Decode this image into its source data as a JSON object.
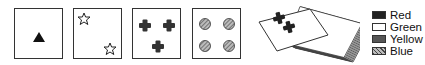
{
  "cards": [
    {
      "shape": "triangle",
      "count": 1,
      "color": "Red"
    },
    {
      "shape": "star",
      "count": 2,
      "color": "Green"
    },
    {
      "shape": "cross",
      "count": 3,
      "color": "Yellow"
    },
    {
      "shape": "circle",
      "count": 4,
      "color": "Blue"
    }
  ],
  "deck": {
    "top_card": {
      "shape": "cross",
      "count": 2,
      "color": "Yellow"
    }
  },
  "legend": {
    "items": [
      {
        "label": "Red",
        "pattern": "solid-dark"
      },
      {
        "label": "Green",
        "pattern": "white"
      },
      {
        "label": "Yellow",
        "pattern": "dark-gray"
      },
      {
        "label": "Blue",
        "pattern": "hatched"
      }
    ]
  }
}
